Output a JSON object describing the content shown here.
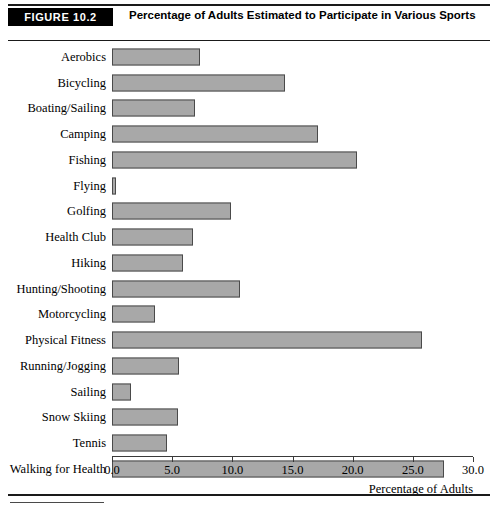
{
  "figure": {
    "badge_label": "FIGURE 10.2",
    "title": "Percentage of Adults Estimated to Participate in Various Sports"
  },
  "chart_data": {
    "type": "bar",
    "orientation": "horizontal",
    "title": "Percentage of Adults Estimated to Participate in Various Sports",
    "xlabel": "Percentage of Adults",
    "ylabel": "",
    "xlim": [
      0.0,
      30.0
    ],
    "xticks": [
      "0.0",
      "5.0",
      "10.0",
      "15.0",
      "20.0",
      "25.0",
      "30.0"
    ],
    "xtick_values": [
      0.0,
      5.0,
      10.0,
      15.0,
      20.0,
      25.0,
      30.0
    ],
    "grid": false,
    "legend": false,
    "bar_fill_color": "#a8a8a8",
    "bar_edge_color": "#4a4a4a",
    "categories": [
      "Aerobics",
      "Bicycling",
      "Boating/Sailing",
      "Camping",
      "Fishing",
      "Flying",
      "Golfing",
      "Health Club",
      "Hiking",
      "Hunting/Shooting",
      "Motorcycling",
      "Physical Fitness",
      "Running/Jogging",
      "Sailing",
      "Snow Skiing",
      "Tennis",
      "Walking for Health"
    ],
    "values": [
      7.3,
      14.4,
      6.9,
      17.1,
      20.4,
      0.3,
      9.9,
      6.7,
      5.9,
      10.6,
      3.6,
      25.8,
      5.6,
      1.6,
      5.5,
      4.6,
      27.6
    ]
  }
}
